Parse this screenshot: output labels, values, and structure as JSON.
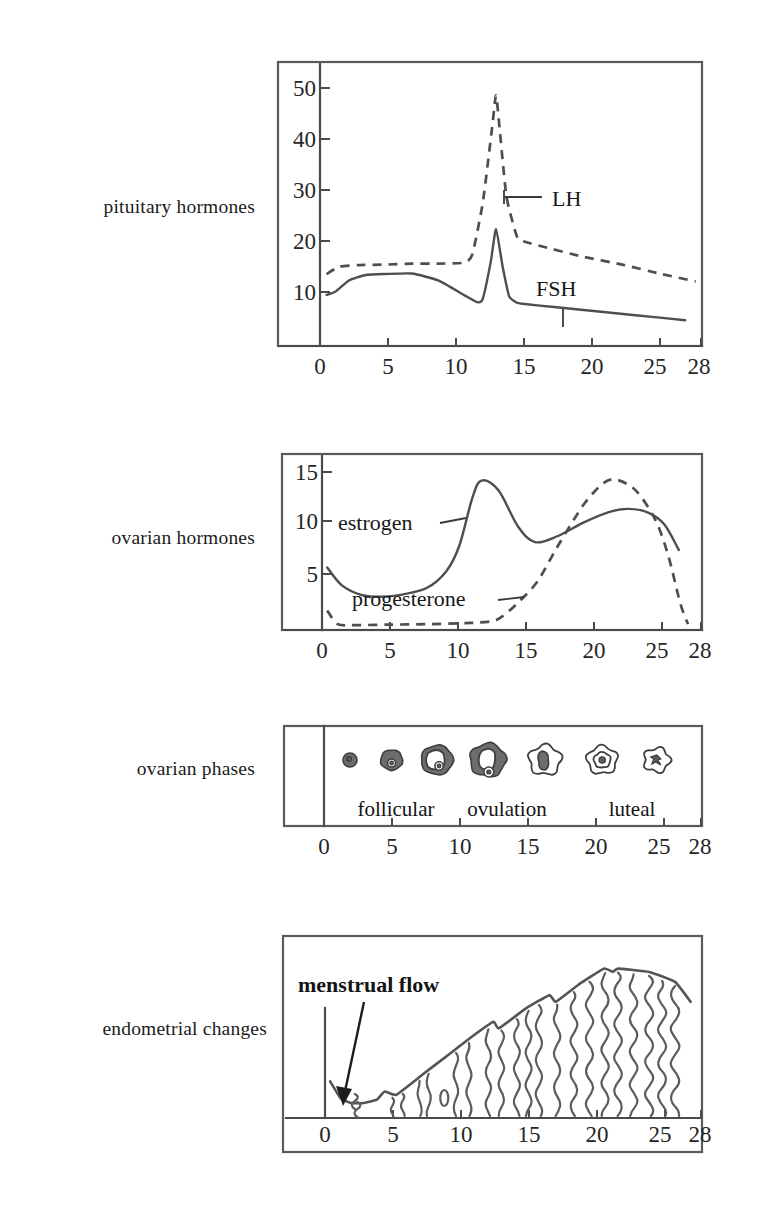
{
  "figure": {
    "x_unit": "day of cycle"
  },
  "rows": [
    {
      "id": "pituitary",
      "label": "pituitary hormones"
    },
    {
      "id": "ovarian_h",
      "label": "ovarian hormones"
    },
    {
      "id": "ovarian_p",
      "label": "ovarian phases"
    },
    {
      "id": "endometrial",
      "label": "endometrial changes"
    }
  ],
  "axis": {
    "x_ticks": [
      0,
      5,
      10,
      15,
      20,
      25,
      28
    ],
    "x_tick_labels": [
      "0",
      "5",
      "10",
      "15",
      "20",
      "25",
      "28"
    ],
    "x_min": 0,
    "x_max": 29
  },
  "chart_data": [
    {
      "id": "pituitary",
      "type": "line",
      "title": "pituitary hormones",
      "xlabel": "day of cycle",
      "ylabel": "",
      "xlim": [
        0,
        29
      ],
      "ylim": [
        0,
        55
      ],
      "grid": false,
      "legend": "inline-labels",
      "y_ticks": [
        10,
        20,
        30,
        40,
        50
      ],
      "y_tick_labels": [
        "10",
        "20",
        "30",
        "40",
        "50"
      ],
      "x_ticks": [
        0,
        5,
        10,
        15,
        20,
        25,
        28
      ],
      "x_tick_labels": [
        "0",
        "5",
        "10",
        "15",
        "20",
        "25",
        "28"
      ],
      "series": [
        {
          "name": "LH",
          "style": "dashed",
          "label": "LH",
          "x": [
            0.5,
            1.5,
            3,
            5,
            7,
            9,
            11,
            11.6,
            12.4,
            13.1,
            13.4,
            13.7,
            14.2,
            15,
            15.6,
            17,
            20,
            23,
            26,
            28.6
          ],
          "values": [
            14.5,
            16,
            16.3,
            16.4,
            16.6,
            16.6,
            16.8,
            18.5,
            29,
            44,
            50.5,
            43,
            30,
            22,
            21,
            20,
            18,
            16.4,
            14.5,
            13
          ]
        },
        {
          "name": "FSH",
          "style": "solid",
          "label": "FSH",
          "x": [
            0.5,
            1.2,
            2.2,
            3.5,
            5,
            7,
            9,
            11,
            12,
            12.4,
            13,
            13.4,
            13.9,
            14.4,
            15,
            15.4,
            18,
            21,
            24,
            27.8
          ],
          "values": [
            10.3,
            11,
            13.2,
            14.3,
            14.5,
            14.6,
            13.2,
            10.2,
            8.8,
            9.6,
            17,
            23.5,
            16,
            10,
            8.7,
            8.5,
            7.8,
            7.0,
            6.2,
            5.2
          ]
        }
      ]
    },
    {
      "id": "ovarian_h",
      "type": "line",
      "title": "ovarian hormones",
      "xlabel": "day of cycle",
      "ylabel": "",
      "xlim": [
        0,
        29
      ],
      "ylim": [
        0,
        17
      ],
      "grid": false,
      "legend": "inline-labels",
      "y_ticks": [
        5,
        10,
        15
      ],
      "y_tick_labels": [
        "5",
        "10",
        "15"
      ],
      "x_ticks": [
        0,
        5,
        10,
        15,
        20,
        25,
        28
      ],
      "x_tick_labels": [
        "0",
        "5",
        "10",
        "15",
        "20",
        "25",
        "28"
      ],
      "series": [
        {
          "name": "estrogen",
          "style": "solid",
          "label": "estrogen",
          "x": [
            0.4,
            1.5,
            3,
            4.5,
            6,
            8,
            9.5,
            10.5,
            11.5,
            12.2,
            13.5,
            15,
            16.3,
            18,
            20,
            22,
            23.5,
            25,
            26.2,
            27.3
          ],
          "values": [
            6.4,
            4.6,
            3.6,
            3.4,
            3.6,
            4.3,
            6.0,
            8.6,
            13.5,
            15.3,
            14.3,
            10.6,
            9.0,
            9.6,
            11.0,
            12.1,
            12.4,
            12.0,
            10.8,
            8.2
          ]
        },
        {
          "name": "progesterone",
          "style": "dashed",
          "label": "progesterone",
          "x": [
            0.4,
            1.2,
            2.5,
            5,
            8,
            11,
            13,
            13.8,
            15,
            16.5,
            18,
            20,
            21.5,
            22.5,
            24,
            25.5,
            26.5,
            27.4,
            28
          ],
          "values": [
            2.0,
            0.6,
            0.5,
            0.55,
            0.6,
            0.7,
            0.9,
            1.4,
            2.8,
            5.0,
            8.5,
            12.8,
            15.0,
            15.4,
            14.3,
            11.3,
            7.6,
            2.8,
            0.6
          ]
        }
      ]
    },
    {
      "id": "ovarian_p",
      "type": "pictogram",
      "title": "ovarian phases",
      "xlabel": "day of cycle",
      "xlim": [
        0,
        29
      ],
      "x_ticks": [
        0,
        5,
        10,
        15,
        20,
        25,
        28
      ],
      "x_tick_labels": [
        "0",
        "5",
        "10",
        "15",
        "20",
        "25",
        "28"
      ],
      "phase_labels": [
        {
          "text": "follicular",
          "x": 6.0
        },
        {
          "text": "ovulation",
          "x": 14.2
        },
        {
          "text": "luteal",
          "x": 23.4
        }
      ],
      "structures": [
        {
          "name": "primordial-follicle",
          "x": 2.0,
          "radius": 7,
          "kind": "filled"
        },
        {
          "name": "primary-follicle",
          "x": 5.2,
          "radius": 11,
          "kind": "filled-nucleus"
        },
        {
          "name": "secondary-follicle",
          "x": 8.7,
          "radius": 16,
          "kind": "antral"
        },
        {
          "name": "graafian-follicle",
          "x": 12.6,
          "radius": 18,
          "kind": "ovulating"
        },
        {
          "name": "corpus-hemorrhagicum",
          "x": 17.0,
          "radius": 16,
          "kind": "corpus-early"
        },
        {
          "name": "corpus-luteum",
          "x": 21.4,
          "radius": 15,
          "kind": "corpus-luteum"
        },
        {
          "name": "corpus-albicans",
          "x": 25.6,
          "radius": 13,
          "kind": "corpus-albicans"
        }
      ]
    },
    {
      "id": "endometrial",
      "type": "area",
      "title": "endometrial changes",
      "xlabel": "day of cycle",
      "xlim": [
        0,
        29
      ],
      "ylim": [
        0,
        100
      ],
      "x_ticks": [
        0,
        5,
        10,
        15,
        20,
        25,
        28
      ],
      "x_tick_labels": [
        "0",
        "5",
        "10",
        "15",
        "20",
        "25",
        "28"
      ],
      "annotation": {
        "text": "menstrual flow",
        "x": 2.2,
        "y": 12
      },
      "thickness": {
        "name": "endometrium thickness",
        "x": [
          0.4,
          1.2,
          2.0,
          3.0,
          4.0,
          4.6,
          5.5,
          7.5,
          9.5,
          11.5,
          13.0,
          13.4,
          15.5,
          17.3,
          17.8,
          19.5,
          21.5,
          22.2,
          22.6,
          25.0,
          27.0,
          28.2
        ],
        "values": [
          22,
          12,
          9,
          9,
          11,
          16,
          14,
          26,
          38,
          50,
          58,
          54,
          66,
          74,
          70,
          80,
          90,
          88,
          90,
          88,
          82,
          70
        ]
      }
    }
  ]
}
